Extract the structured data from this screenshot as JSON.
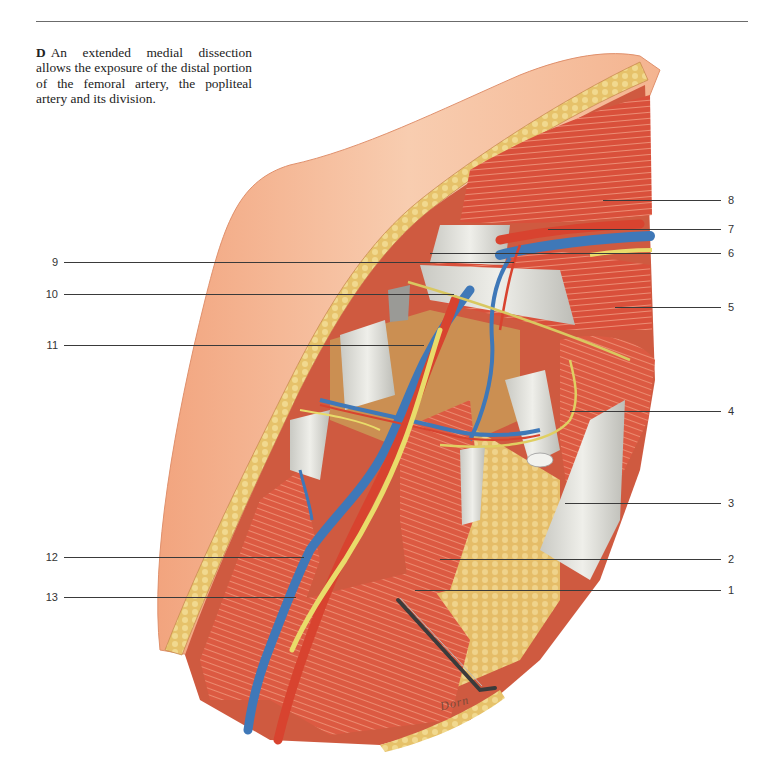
{
  "caption": {
    "letter": "D",
    "text": "An extended medial dissection allows the exposure of the distal portion of the femoral artery, the popliteal artery and its division."
  },
  "labels": {
    "left": [
      {
        "num": "9",
        "y": 262
      },
      {
        "num": "10",
        "y": 294
      },
      {
        "num": "11",
        "y": 345
      },
      {
        "num": "12",
        "y": 557
      },
      {
        "num": "13",
        "y": 597
      }
    ],
    "right": [
      {
        "num": "8",
        "y": 200
      },
      {
        "num": "7",
        "y": 229
      },
      {
        "num": "6",
        "y": 253
      },
      {
        "num": "5",
        "y": 307
      },
      {
        "num": "4",
        "y": 411
      },
      {
        "num": "3",
        "y": 503
      },
      {
        "num": "2",
        "y": 559
      },
      {
        "num": "1",
        "y": 590
      }
    ]
  },
  "signature": "Dorn",
  "colors": {
    "skin": "#f3b08a",
    "skin_light": "#f8cdb0",
    "fat": "#e8c56a",
    "muscle": "#d9553e",
    "muscle_light": "#ee8a6c",
    "tendon": "#d8d8d2",
    "artery": "#d8432f",
    "vein": "#3f78b8",
    "nerve": "#e9dc6a",
    "retractor": "#3b3b3b"
  }
}
